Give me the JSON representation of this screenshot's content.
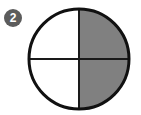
{
  "figure": {
    "name": "fraction-circle-diagram",
    "type": "fraction model",
    "background_color": "#ffffff"
  },
  "badge": {
    "icon_name": "numbered-badge-icon",
    "number": "2",
    "fill_color": "#5c5c5c",
    "text_color": "#ffffff",
    "cx": 13,
    "cy": 18,
    "radius": 9
  },
  "circle": {
    "cx": 79,
    "cy": 59,
    "radius": 50,
    "outline_color": "#111111",
    "outline_width": 3,
    "unshaded_color": "#ffffff",
    "shaded_color": "#808080",
    "divider_color": "#1a1a1a",
    "divider_width": 2
  },
  "chart_data": {
    "type": "pie",
    "title": "",
    "subtitle": "",
    "xlabel": "",
    "ylabel": "",
    "total_parts": 4,
    "shaded_parts": 2,
    "fraction_label": "2/4",
    "categories": [
      "upper-left quadrant",
      "upper-right quadrant",
      "lower-right quadrant",
      "lower-left quadrant"
    ],
    "values": [
      25,
      25,
      25,
      25
    ],
    "slice_states": [
      "unshaded",
      "shaded",
      "shaded",
      "unshaded"
    ],
    "slice_colors": [
      "#ffffff",
      "#808080",
      "#808080",
      "#ffffff"
    ],
    "legend": [],
    "legend_position": "none",
    "grid": false,
    "annotations": [
      "2"
    ]
  }
}
